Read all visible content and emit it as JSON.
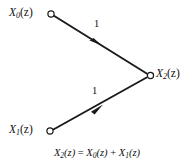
{
  "figure": {
    "type": "signal-flow-graph",
    "background_color": "#ffffff",
    "line_color": "#1a1a1a",
    "nodes": [
      {
        "id": "x0",
        "label_main": "X",
        "label_sub": "0",
        "label_paren": "(z)",
        "label_full": "X0(z)",
        "x": 51,
        "y": 14
      },
      {
        "id": "x1",
        "label_main": "X",
        "label_sub": "1",
        "label_paren": "(z)",
        "label_full": "X1(z)",
        "x": 50,
        "y": 131
      },
      {
        "id": "x2",
        "label_main": "X",
        "label_sub": "2",
        "label_paren": "(z)",
        "label_full": "X2(z)",
        "x": 150,
        "y": 75
      }
    ],
    "branches": [
      {
        "id": "branch-x0-x2",
        "from": "x0",
        "to": "x2",
        "gain": "1",
        "arrow_at": {
          "x": 97,
          "y": 42
        }
      },
      {
        "id": "branch-x1-x2",
        "from": "x1",
        "to": "x2",
        "gain": "1",
        "arrow_at": {
          "x": 98,
          "y": 108
        }
      }
    ],
    "equation": {
      "lhs_main": "X",
      "lhs_sub": "2",
      "lhs_paren": "(z)",
      "equals": " = ",
      "rhs1_main": "X",
      "rhs1_sub": "0",
      "rhs1_paren": "(z)",
      "plus": " + ",
      "rhs2_main": "X",
      "rhs2_sub": "1",
      "rhs2_paren": "(z)",
      "text": "X2(z) = X0(z) + X1(z)"
    }
  }
}
